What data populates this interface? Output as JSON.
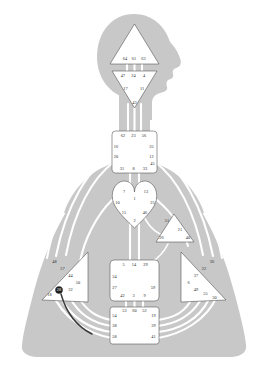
{
  "chart": {
    "type": "bodygraph",
    "colors": {
      "background": "#ffffff",
      "body_silhouette": "#c8c8c8",
      "channel_line": "#ffffff",
      "center_fill": "#ffffff",
      "center_stroke": "#4a4a4a",
      "gate_text": "#2a2a2a",
      "highlight": "#1e1e1e"
    }
  },
  "centers": {
    "head": {
      "name": "Head Center",
      "shape": "triangle",
      "gates": [
        {
          "number": "64",
          "x": 125.0,
          "y": 59.5
        },
        {
          "number": "61",
          "x": 134.0,
          "y": 59.5
        },
        {
          "number": "63",
          "x": 143.5,
          "y": 59.5
        }
      ]
    },
    "ajna": {
      "name": "Ajna Center",
      "shape": "inverted-triangle",
      "gates": [
        {
          "number": "47",
          "x": 123.0,
          "y": 76.5
        },
        {
          "number": "24",
          "x": 133.5,
          "y": 76.5
        },
        {
          "number": "4",
          "x": 144.0,
          "y": 76.5
        },
        {
          "number": "17",
          "x": 125.5,
          "y": 89.5
        },
        {
          "number": "11",
          "x": 142.0,
          "y": 89.5
        },
        {
          "number": "43",
          "x": 134.5,
          "y": 103.5
        }
      ]
    },
    "throat": {
      "name": "Throat Center",
      "shape": "square",
      "gates": [
        {
          "number": "62",
          "x": 123.0,
          "y": 136.0
        },
        {
          "number": "23",
          "x": 133.5,
          "y": 136.0
        },
        {
          "number": "56",
          "x": 144.0,
          "y": 136.0
        },
        {
          "number": "16",
          "x": 116.0,
          "y": 147.0
        },
        {
          "number": "35",
          "x": 151.5,
          "y": 147.0
        },
        {
          "number": "20",
          "x": 116.0,
          "y": 157.5
        },
        {
          "number": "12",
          "x": 151.5,
          "y": 157.5
        },
        {
          "number": "45",
          "x": 152.5,
          "y": 164.5
        },
        {
          "number": "31",
          "x": 122.0,
          "y": 169.5
        },
        {
          "number": "8",
          "x": 133.5,
          "y": 169.5
        },
        {
          "number": "33",
          "x": 145.0,
          "y": 169.5
        }
      ]
    },
    "g": {
      "name": "G Center",
      "shape": "heart",
      "gates": [
        {
          "number": "7",
          "x": 124.0,
          "y": 192.5
        },
        {
          "number": "13",
          "x": 146.0,
          "y": 192.5
        },
        {
          "number": "1",
          "x": 134.5,
          "y": 199.0
        },
        {
          "number": "10",
          "x": 117.5,
          "y": 203.0
        },
        {
          "number": "25",
          "x": 152.5,
          "y": 203.0
        },
        {
          "number": "15",
          "x": 124.0,
          "y": 213.5
        },
        {
          "number": "46",
          "x": 145.0,
          "y": 213.5
        },
        {
          "number": "2",
          "x": 134.5,
          "y": 221.5
        }
      ]
    },
    "ego": {
      "name": "Ego / Heart Center",
      "shape": "triangle",
      "gates": [
        {
          "number": "51",
          "x": 167.0,
          "y": 221.0
        },
        {
          "number": "21",
          "x": 180.0,
          "y": 230.5
        },
        {
          "number": "26",
          "x": 161.5,
          "y": 238.5
        },
        {
          "number": "40",
          "x": 188.0,
          "y": 238.5
        }
      ]
    },
    "spleen": {
      "name": "Spleen Center",
      "shape": "triangle-left",
      "gates": [
        {
          "number": "48",
          "x": 54.5,
          "y": 262.0
        },
        {
          "number": "57",
          "x": 62.5,
          "y": 269.0
        },
        {
          "number": "44",
          "x": 70.5,
          "y": 276.5
        },
        {
          "number": "50",
          "x": 78.0,
          "y": 283.5
        },
        {
          "number": "32",
          "x": 70.5,
          "y": 290.0
        },
        {
          "number": "28",
          "x": 59.0,
          "y": 290.5,
          "highlight": true
        },
        {
          "number": "18",
          "x": 49.5,
          "y": 295.5
        }
      ]
    },
    "solar_plexus": {
      "name": "Solar Plexus Center",
      "shape": "triangle-right",
      "gates": [
        {
          "number": "36",
          "x": 212.0,
          "y": 262.0
        },
        {
          "number": "22",
          "x": 204.0,
          "y": 269.0
        },
        {
          "number": "37",
          "x": 196.0,
          "y": 276.5
        },
        {
          "number": "6",
          "x": 188.5,
          "y": 283.5
        },
        {
          "number": "49",
          "x": 196.0,
          "y": 290.0
        },
        {
          "number": "55",
          "x": 205.5,
          "y": 294.0
        },
        {
          "number": "30",
          "x": 214.5,
          "y": 298.5
        }
      ]
    },
    "sacral": {
      "name": "Sacral Center",
      "shape": "square",
      "gates": [
        {
          "number": "5",
          "x": 123.5,
          "y": 265.5
        },
        {
          "number": "14",
          "x": 134.0,
          "y": 265.5
        },
        {
          "number": "29",
          "x": 145.5,
          "y": 265.5
        },
        {
          "number": "34",
          "x": 114.5,
          "y": 277.0
        },
        {
          "number": "27",
          "x": 114.5,
          "y": 288.0
        },
        {
          "number": "59",
          "x": 153.0,
          "y": 288.0
        },
        {
          "number": "42",
          "x": 122.5,
          "y": 296.5
        },
        {
          "number": "3",
          "x": 133.5,
          "y": 296.5
        },
        {
          "number": "9",
          "x": 144.5,
          "y": 296.5
        }
      ]
    },
    "root": {
      "name": "Root Center",
      "shape": "square",
      "gates": [
        {
          "number": "53",
          "x": 124.5,
          "y": 311.0
        },
        {
          "number": "60",
          "x": 134.5,
          "y": 311.0
        },
        {
          "number": "52",
          "x": 144.5,
          "y": 311.0
        },
        {
          "number": "54",
          "x": 114.5,
          "y": 316.0
        },
        {
          "number": "19",
          "x": 153.5,
          "y": 316.0
        },
        {
          "number": "38",
          "x": 114.5,
          "y": 326.5
        },
        {
          "number": "39",
          "x": 153.5,
          "y": 326.5
        },
        {
          "number": "58",
          "x": 114.5,
          "y": 337.0
        },
        {
          "number": "41",
          "x": 153.5,
          "y": 337.0
        }
      ]
    }
  }
}
